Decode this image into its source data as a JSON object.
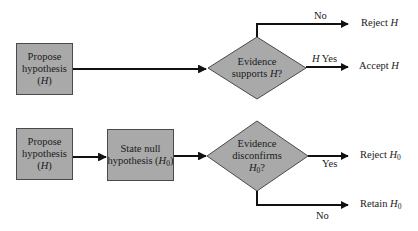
{
  "diagram_top": {
    "propose_box": {
      "line1": "Propose",
      "line2": "hypothesis",
      "line3_open": "(",
      "line3_var": "H",
      "line3_close": ")"
    },
    "decision": {
      "line1": "Evidence",
      "line2_text": "supports ",
      "line2_var": "H",
      "line2_end": "?"
    },
    "no_branch_label": "No",
    "yes_branch_label_var": "H",
    "yes_branch_label": " Yes",
    "outcome_no": {
      "text": "Reject ",
      "var": "H"
    },
    "outcome_yes": {
      "text": "Accept ",
      "var": "H"
    }
  },
  "diagram_bottom": {
    "propose_box": {
      "line1": "Propose",
      "line2": "hypothesis",
      "line3_open": "(",
      "line3_var": "H",
      "line3_close": ")"
    },
    "null_box": {
      "line1": "State null",
      "line2_text": "hypothesis (",
      "line2_var": "H",
      "line2_sub": "0",
      "line2_close": ")"
    },
    "decision": {
      "line1": "Evidence",
      "line2": "disconfirms",
      "line3_var": "H",
      "line3_sub": "0",
      "line3_end": "?"
    },
    "yes_branch_label": "Yes",
    "no_branch_label": "No",
    "outcome_yes": {
      "text": "Reject ",
      "var": "H",
      "sub": "0"
    },
    "outcome_no": {
      "text": "Retain ",
      "var": "H",
      "sub": "0"
    }
  },
  "colors": {
    "box_fill": "#a9a9a9",
    "line": "#111111",
    "border": "#4a4a4a"
  }
}
